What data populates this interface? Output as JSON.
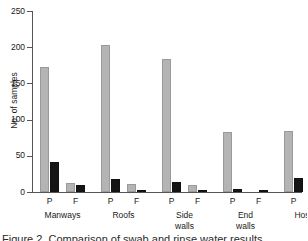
{
  "chart_data": {
    "type": "bar",
    "title": "",
    "xlabel": "",
    "ylabel": "No. of samples",
    "ylim": [
      0,
      250
    ],
    "yticks": [
      0,
      50,
      100,
      150,
      200,
      250
    ],
    "ytick_labels": [
      "0",
      "50",
      "100",
      "150",
      "200",
      "250"
    ],
    "grid": false,
    "legend": "none",
    "categories": [
      "Manways P",
      "Manways F",
      "Roofs P",
      "Roofs F",
      "Side walls P",
      "Side walls F",
      "End walls P",
      "End walls F",
      "Hoses P",
      "Hoses F",
      "AEVs P",
      "AEVs F",
      "Rinse waters P",
      "Rinse waters F"
    ],
    "groups": [
      {
        "name": "Manways",
        "lines": [
          "Manways"
        ],
        "subcategories": [
          "P",
          "F"
        ]
      },
      {
        "name": "Roofs",
        "lines": [
          "Roofs"
        ],
        "subcategories": [
          "P",
          "F"
        ]
      },
      {
        "name": "Side walls",
        "lines": [
          "Side",
          "walls"
        ],
        "subcategories": [
          "P",
          "F"
        ]
      },
      {
        "name": "End walls",
        "lines": [
          "End",
          "walls"
        ],
        "subcategories": [
          "P",
          "F"
        ]
      },
      {
        "name": "Hoses",
        "lines": [
          "Hoses"
        ],
        "subcategories": [
          "P",
          "F"
        ]
      },
      {
        "name": "AEVs",
        "lines": [
          "AEVs"
        ],
        "subcategories": [
          "P",
          "F"
        ]
      },
      {
        "name": "Rinse waters",
        "lines": [
          "Rinse",
          "waters"
        ],
        "subcategories": [
          "P",
          "F"
        ]
      }
    ],
    "series": [
      {
        "name": "grey-series",
        "color": "#b4b4b4",
        "values": [
          172,
          12,
          203,
          11,
          184,
          9,
          83,
          0,
          84,
          35,
          69,
          12,
          51,
          11
        ]
      },
      {
        "name": "black-series",
        "color": "#151515",
        "values": [
          42,
          9,
          18,
          2,
          14,
          2,
          4,
          2,
          20,
          44,
          11,
          7,
          57,
          59
        ]
      }
    ],
    "colors": {
      "grey_bar": "#b4b4b4",
      "black_bar": "#151515",
      "axis": "#555555",
      "text": "#1a1a1a",
      "background": "#ffffff"
    }
  },
  "caption": {
    "text_sliver": "Figure 2. Comparison of swab and rinse water results"
  }
}
